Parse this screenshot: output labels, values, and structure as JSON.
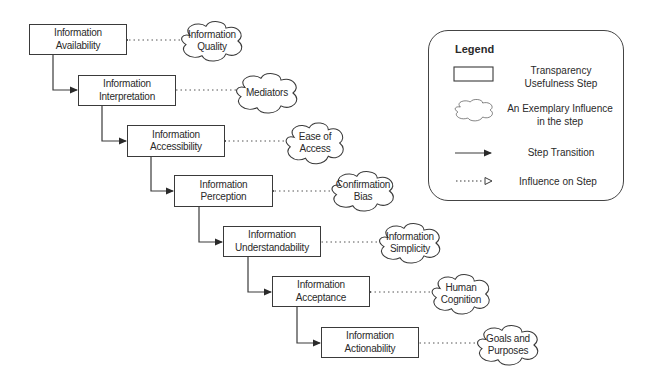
{
  "diagram": {
    "steps": [
      {
        "line1": "Information",
        "line2": "Availability"
      },
      {
        "line1": "Information",
        "line2": "Interpretation"
      },
      {
        "line1": "Information",
        "line2": "Accessibility"
      },
      {
        "line1": "Information",
        "line2": "Perception"
      },
      {
        "line1": "Information",
        "line2": "Understandability"
      },
      {
        "line1": "Information",
        "line2": "Acceptance"
      },
      {
        "line1": "Information",
        "line2": "Actionability"
      }
    ],
    "influences": [
      {
        "line1": "Information",
        "line2": "Quality"
      },
      {
        "line1": "Mediators",
        "line2": ""
      },
      {
        "line1": "Ease of",
        "line2": "Access"
      },
      {
        "line1": "Confirmation",
        "line2": "Bias"
      },
      {
        "line1": "Information",
        "line2": "Simplicity"
      },
      {
        "line1": "Human",
        "line2": "Cognition"
      },
      {
        "line1": "Goals and",
        "line2": "Purposes"
      }
    ]
  },
  "legend": {
    "title": "Legend",
    "items": [
      {
        "icon": "rectangle-icon",
        "line1": "Transparency",
        "line2": "Usefulness Step"
      },
      {
        "icon": "cloud-icon",
        "line1": "An Exemplary Influence",
        "line2": "in the step"
      },
      {
        "icon": "solid-arrow-icon",
        "line1": "Step Transition",
        "line2": ""
      },
      {
        "icon": "dotted-arrow-icon",
        "line1": "Influence on Step",
        "line2": ""
      }
    ]
  },
  "colors": {
    "line": "#3a3a3a",
    "background": "#ffffff"
  }
}
